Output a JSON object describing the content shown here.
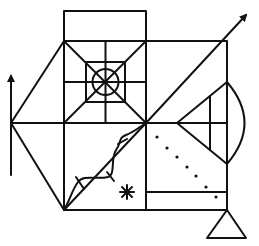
{
  "figure": {
    "name": "Rey-Osterrieth complex figure",
    "stroke_color": "#111111",
    "background": "#ffffff",
    "elements": [
      "top-box",
      "main-rectangle",
      "center-cross",
      "diagonal-cross",
      "inner-square-with-circle",
      "left-triangle",
      "left-arrow",
      "right-diagonal-arrow",
      "right-triangle-with-arc",
      "wavy-line-with-ticks",
      "asterisk",
      "dotted-diagonal",
      "bottom-strip",
      "bottom-triangle"
    ],
    "dot_count": 7
  }
}
